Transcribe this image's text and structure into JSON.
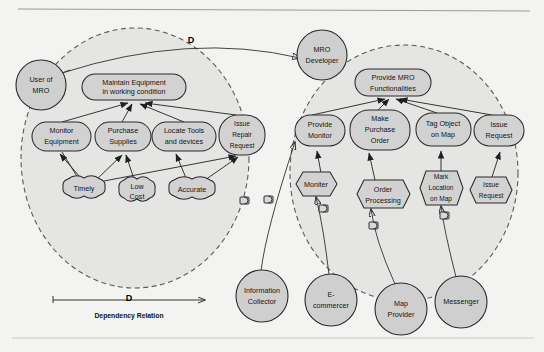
{
  "diagram": {
    "type": "goal-model",
    "colors": {
      "background": "#f3f3f2",
      "boundary_fill": "#e2e2e2",
      "node_fill": "#d2d2d2",
      "actor_fill": "#cfcfcf",
      "stroke": "#2a2a2a"
    }
  },
  "legend": {
    "marker": "D",
    "label": "Dependency Relation"
  },
  "actors": [
    {
      "id": "user-of-mro",
      "label": "User of\nMRO",
      "lines": [
        "User of",
        "MRO"
      ],
      "cx": 41,
      "cy": 85,
      "r": 25
    },
    {
      "id": "mro-developer",
      "label": "MRO\nDeveloper",
      "lines": [
        "MRO",
        "Developer"
      ],
      "cx": 322,
      "cy": 55,
      "r": 25
    },
    {
      "id": "information-collector",
      "label": "Information\nCollector",
      "lines": [
        "Information",
        "Collector"
      ],
      "cx": 262,
      "cy": 296,
      "r": 26
    },
    {
      "id": "e-commercer",
      "label": "E-\ncommercer",
      "lines": [
        "E-",
        "commercer"
      ],
      "cx": 331,
      "cy": 300,
      "r": 26
    },
    {
      "id": "map-provider",
      "label": "Map\nProvider",
      "lines": [
        "Map",
        "Provider"
      ],
      "cx": 401,
      "cy": 309,
      "r": 26
    },
    {
      "id": "messenger",
      "label": "Messenger",
      "lines": [
        "Messenger"
      ],
      "cx": 461,
      "cy": 302,
      "r": 26
    }
  ],
  "boundaries": [
    {
      "id": "user-boundary",
      "owner": "User of MRO",
      "cx": 135,
      "cy": 158,
      "rx": 114,
      "ry": 130
    },
    {
      "id": "developer-boundary",
      "owner": "MRO Developer",
      "cx": 404,
      "cy": 173,
      "rx": 114,
      "ry": 128
    }
  ],
  "goals": [
    {
      "id": "maintain-equipment",
      "lines": [
        "Maintain Equipment",
        "in working condition"
      ],
      "x": 82,
      "y": 74,
      "w": 104,
      "h": 26,
      "actor": "user-of-mro"
    },
    {
      "id": "monitor-equipment",
      "lines": [
        "Monitor",
        "Equipment"
      ],
      "x": 32,
      "y": 122,
      "w": 59,
      "h": 29,
      "actor": "user-of-mro"
    },
    {
      "id": "purchase-supplies",
      "lines": [
        "Purchase",
        "Supplies"
      ],
      "x": 95,
      "y": 122,
      "w": 56,
      "h": 29,
      "actor": "user-of-mro"
    },
    {
      "id": "locate-tools",
      "lines": [
        "Locate Tools",
        "and devices"
      ],
      "x": 152,
      "y": 122,
      "w": 64,
      "h": 29,
      "actor": "user-of-mro"
    },
    {
      "id": "issue-repair-request",
      "lines": [
        "Issue",
        "Repair",
        "Request"
      ],
      "x": 219,
      "y": 115,
      "w": 46,
      "h": 40,
      "actor": "user-of-mro"
    },
    {
      "id": "provide-mro-functionalities",
      "lines": [
        "Provide MRO",
        "Functionalities"
      ],
      "x": 355,
      "y": 69,
      "w": 76,
      "h": 27,
      "actor": "mro-developer"
    },
    {
      "id": "provide-monitor",
      "lines": [
        "Provide",
        "Monitor"
      ],
      "x": 295,
      "y": 115,
      "w": 50,
      "h": 31,
      "actor": "mro-developer"
    },
    {
      "id": "make-purchase-order",
      "lines": [
        "Make",
        "Purchase",
        "Order"
      ],
      "x": 350,
      "y": 110,
      "w": 60,
      "h": 40,
      "actor": "mro-developer"
    },
    {
      "id": "tag-object-on-map",
      "lines": [
        "Tag Object",
        "on Map"
      ],
      "x": 416,
      "y": 113,
      "w": 55,
      "h": 33,
      "actor": "mro-developer"
    },
    {
      "id": "issue-request-goal",
      "lines": [
        "Issue",
        "Request"
      ],
      "x": 474,
      "y": 115,
      "w": 50,
      "h": 31,
      "actor": "mro-developer"
    }
  ],
  "softgoals": [
    {
      "id": "timely",
      "lines": [
        "Timely"
      ],
      "cx": 84,
      "cy": 188,
      "w": 48,
      "h": 23
    },
    {
      "id": "low-cost",
      "lines": [
        "Low",
        "Cost"
      ],
      "cx": 137,
      "cy": 191,
      "w": 41,
      "h": 26
    },
    {
      "id": "accurate",
      "lines": [
        "Accurate"
      ],
      "cx": 192,
      "cy": 189,
      "w": 52,
      "h": 23
    }
  ],
  "tasks": [
    {
      "id": "monitor-task",
      "lines": [
        "Moniter"
      ],
      "cx": 316,
      "cy": 184,
      "w": 52,
      "h": 25
    },
    {
      "id": "order-processing-task",
      "lines": [
        "Order",
        "Processing"
      ],
      "cx": 383,
      "cy": 194,
      "w": 52,
      "h": 29
    },
    {
      "id": "mark-location-task",
      "lines": [
        "Mark",
        "Location",
        "on Map"
      ],
      "cx": 441,
      "cy": 188,
      "w": 43,
      "h": 35
    },
    {
      "id": "issue-request-task",
      "lines": [
        "Issue",
        "Request"
      ],
      "cx": 491,
      "cy": 190,
      "w": 43,
      "h": 28
    }
  ],
  "dependencies": [
    {
      "id": "dep-user-developer",
      "from": "User of MRO",
      "to": "MRO Developer",
      "marker": "D"
    },
    {
      "id": "dep-info-collector",
      "from": "Information Collector",
      "to": "Provide Monitor",
      "marker": "D"
    },
    {
      "id": "dep-e-commercer",
      "from": "E-commercer",
      "to": "Moniter",
      "marker": "D"
    },
    {
      "id": "dep-map-provider",
      "from": "Map Provider",
      "to": "Order Processing",
      "marker": "D"
    },
    {
      "id": "dep-messenger",
      "from": "Messenger",
      "to": "Mark Location on Map",
      "marker": "D"
    }
  ]
}
